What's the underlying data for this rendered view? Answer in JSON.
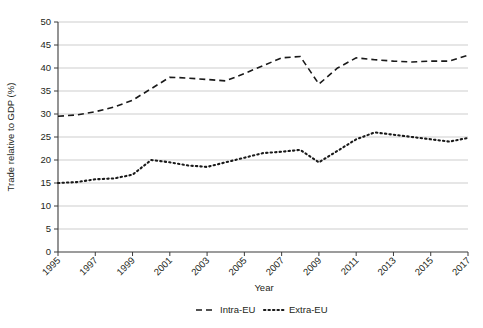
{
  "chart_data": {
    "type": "line",
    "title": "",
    "xlabel": "Year",
    "ylabel": "Trade relative to GDP (%)",
    "x": [
      1995,
      1996,
      1997,
      1998,
      1999,
      2000,
      2001,
      2002,
      2003,
      2004,
      2005,
      2006,
      2007,
      2008,
      2009,
      2010,
      2011,
      2012,
      2013,
      2014,
      2015,
      2016,
      2017
    ],
    "xlim": [
      1995,
      2017
    ],
    "ylim": [
      0,
      50
    ],
    "yticks": [
      0,
      5,
      10,
      15,
      20,
      25,
      30,
      35,
      40,
      45,
      50
    ],
    "xticks": [
      1995,
      1997,
      1999,
      2001,
      2003,
      2005,
      2007,
      2009,
      2011,
      2013,
      2015,
      2017
    ],
    "xtick_labels": [
      "1995",
      "1997",
      "1999",
      "2001",
      "2003",
      "2005",
      "2007",
      "2009",
      "2011",
      "2013",
      "2015",
      "2017"
    ],
    "ytick_labels": [
      "0",
      "5",
      "10",
      "15",
      "20",
      "25",
      "30",
      "35",
      "40",
      "45",
      "50"
    ],
    "xtick_rotation": 45,
    "grid": "horizontal",
    "legend_position": "bottom",
    "series": [
      {
        "name": "Intra-EU",
        "style": "dashed",
        "color": "#1a1a1a",
        "values": [
          29.5,
          29.8,
          30.5,
          31.5,
          33.0,
          35.5,
          38.0,
          37.8,
          37.5,
          37.2,
          38.8,
          40.5,
          42.2,
          42.5,
          36.5,
          40.0,
          42.2,
          41.8,
          41.5,
          41.3,
          41.5,
          41.5,
          42.8
        ]
      },
      {
        "name": "Extra-EU",
        "style": "dotted",
        "color": "#1a1a1a",
        "values": [
          15.0,
          15.2,
          15.8,
          16.0,
          16.8,
          20.0,
          19.5,
          18.8,
          18.5,
          19.5,
          20.5,
          21.5,
          21.8,
          22.2,
          19.5,
          22.0,
          24.5,
          26.0,
          25.5,
          25.0,
          24.5,
          24.0,
          24.8
        ]
      }
    ]
  },
  "legend": {
    "items": [
      {
        "label": "Intra-EU",
        "style": "dashed"
      },
      {
        "label": "Extra-EU",
        "style": "dotted"
      }
    ]
  }
}
